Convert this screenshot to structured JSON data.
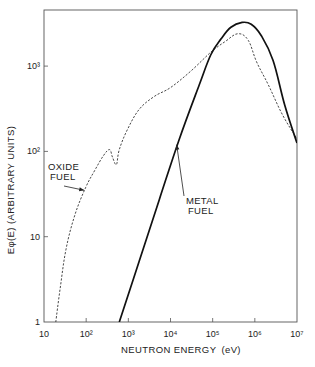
{
  "chart_data": {
    "type": "line",
    "title": "",
    "xlabel": "NEUTRON ENERGY (eV)",
    "ylabel": "Eφ(E) (ARBITRARY UNITS)",
    "xscale": "log",
    "yscale": "log",
    "xlim": [
      10,
      10000000
    ],
    "ylim": [
      1,
      4000
    ],
    "grid": false,
    "legend": "none (inline annotations with arrows)",
    "x_ticks": [
      "10",
      "10²",
      "10³",
      "10⁴",
      "10⁵",
      "10⁶",
      "10⁷"
    ],
    "y_ticks": [
      "1",
      "10",
      "10²",
      "10³"
    ],
    "series": [
      {
        "name": "OXIDE FUEL",
        "style": "dashed",
        "points": [
          {
            "E": 19,
            "phi": 1.0
          },
          {
            "E": 24,
            "phi": 2.4
          },
          {
            "E": 33,
            "phi": 7.0
          },
          {
            "E": 54,
            "phi": 18
          },
          {
            "E": 98,
            "phi": 38
          },
          {
            "E": 160,
            "phi": 60
          },
          {
            "E": 260,
            "phi": 90
          },
          {
            "E": 360,
            "phi": 105
          },
          {
            "E": 420,
            "phi": 86
          },
          {
            "E": 520,
            "phi": 70
          },
          {
            "E": 610,
            "phi": 105
          },
          {
            "E": 950,
            "phi": 180
          },
          {
            "E": 1800,
            "phi": 310
          },
          {
            "E": 4100,
            "phi": 440
          },
          {
            "E": 10000,
            "phi": 560
          },
          {
            "E": 30000,
            "phi": 870
          },
          {
            "E": 90000,
            "phi": 1450
          },
          {
            "E": 200000,
            "phi": 1950
          },
          {
            "E": 400000,
            "phi": 2400
          },
          {
            "E": 700000,
            "phi": 2000
          },
          {
            "E": 1100000,
            "phi": 1120
          },
          {
            "E": 2100000,
            "phi": 600
          },
          {
            "E": 4500000,
            "phi": 270
          },
          {
            "E": 10000000,
            "phi": 140
          }
        ]
      },
      {
        "name": "METAL FUEL",
        "style": "solid",
        "points": [
          {
            "E": 610,
            "phi": 1.0
          },
          {
            "E": 1800,
            "phi": 5.1
          },
          {
            "E": 5400,
            "phi": 27
          },
          {
            "E": 16000,
            "phi": 137
          },
          {
            "E": 48000,
            "phi": 600
          },
          {
            "E": 90000,
            "phi": 1350
          },
          {
            "E": 160000,
            "phi": 2100
          },
          {
            "E": 270000,
            "phi": 2850
          },
          {
            "E": 500000,
            "phi": 3250
          },
          {
            "E": 820000,
            "phi": 3100
          },
          {
            "E": 1400000,
            "phi": 2300
          },
          {
            "E": 2700000,
            "phi": 1170
          },
          {
            "E": 5100000,
            "phi": 350
          },
          {
            "E": 10000000,
            "phi": 125
          }
        ]
      }
    ],
    "annotations": [
      {
        "text": "OXIDE FUEL",
        "arrow_to": {
          "E": 90,
          "phi": 35
        }
      },
      {
        "text": "METAL FUEL",
        "arrow_to": {
          "E": 14000,
          "phi": 120
        }
      }
    ]
  },
  "labels": {
    "xlabel": "NEUTRON ENERGY",
    "xunit": "(eV)",
    "ylabel": "Eφ(E) (ARBITRARY UNITS)",
    "oxide_line1": "OXIDE",
    "oxide_line2": "FUEL",
    "metal_line1": "METAL",
    "metal_line2": "FUEL"
  }
}
